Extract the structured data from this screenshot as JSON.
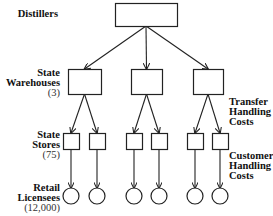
{
  "labels": {
    "distillers": {
      "lines": [
        "Distillers"
      ],
      "count": ""
    },
    "warehouses": {
      "lines": [
        "State",
        "Warehouses"
      ],
      "count": "(3)"
    },
    "stores": {
      "lines": [
        "State",
        "Stores"
      ],
      "count": "(75)"
    },
    "licensees": {
      "lines": [
        "Retail",
        "Licensees"
      ],
      "count": "(12,000)"
    },
    "transfer_costs": {
      "lines": [
        "Transfer",
        "Handling",
        "Costs"
      ]
    },
    "customer_costs": {
      "lines": [
        "Customer",
        "Handling",
        "Costs"
      ]
    }
  },
  "nodes": {
    "distiller": {
      "x": 115,
      "y": 3,
      "w": 62,
      "h": 23
    },
    "warehouses": [
      {
        "x": 68,
        "y": 69,
        "w": 33,
        "h": 25
      },
      {
        "x": 131,
        "y": 69,
        "w": 31,
        "h": 25
      },
      {
        "x": 193,
        "y": 69,
        "w": 30,
        "h": 25
      }
    ],
    "stores": [
      {
        "x": 63,
        "y": 133,
        "w": 16,
        "h": 16,
        "parent": 0
      },
      {
        "x": 89,
        "y": 133,
        "w": 16,
        "h": 16,
        "parent": 0
      },
      {
        "x": 126,
        "y": 133,
        "w": 16,
        "h": 16,
        "parent": 1
      },
      {
        "x": 151,
        "y": 133,
        "w": 16,
        "h": 16,
        "parent": 1
      },
      {
        "x": 187,
        "y": 133,
        "w": 16,
        "h": 16,
        "parent": 2
      },
      {
        "x": 212,
        "y": 133,
        "w": 16,
        "h": 16,
        "parent": 2
      }
    ],
    "licensee_circle": {
      "cy": 196,
      "r": 8
    }
  },
  "colors": {
    "stroke": "#222222",
    "text": "#111111"
  }
}
